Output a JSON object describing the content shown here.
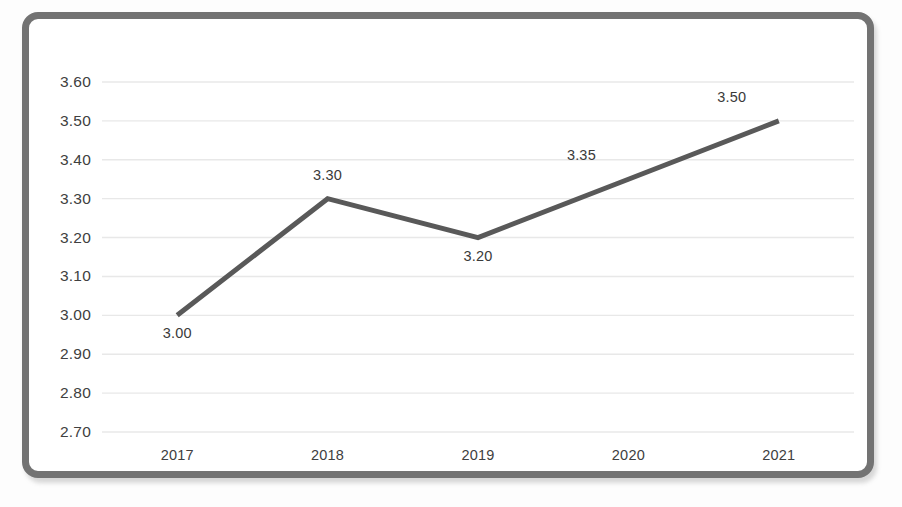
{
  "chart_data": {
    "type": "line",
    "title": "",
    "subtitle": "",
    "xlabel": "",
    "ylabel": "",
    "categories": [
      "2017",
      "2018",
      "2019",
      "2020",
      "2021"
    ],
    "values": [
      3.0,
      3.3,
      3.2,
      3.35,
      3.5
    ],
    "point_labels": [
      "3.00",
      "3.30",
      "3.20",
      "3.35",
      "3.50"
    ],
    "point_label_positions": [
      "below",
      "above",
      "below",
      "above-left",
      "above-left"
    ],
    "ylim": [
      2.7,
      3.6
    ],
    "ytick_step": 0.1,
    "ytick_labels": [
      "3.60",
      "3.50",
      "3.40",
      "3.30",
      "3.20",
      "3.10",
      "3.00",
      "2.90",
      "2.80",
      "2.70"
    ],
    "ytick_values": [
      3.6,
      3.5,
      3.4,
      3.3,
      3.2,
      3.1,
      3.0,
      2.9,
      2.8,
      2.7
    ],
    "grid": true,
    "grid_axis": "horizontal",
    "legend": false,
    "legend_position": "none",
    "series": [
      {
        "name": "",
        "values": [
          3.0,
          3.3,
          3.2,
          3.35,
          3.5
        ]
      }
    ],
    "colors": {
      "line": "#595959",
      "grid": "#e8e8e8",
      "plot_background": "#ffffff",
      "frame_border": "#737373",
      "page_background": "#fdfdfd",
      "tick_text": "#404040",
      "label_text": "#3a3a3a"
    },
    "line_width": 5
  }
}
